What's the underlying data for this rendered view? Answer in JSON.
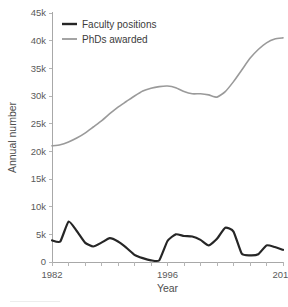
{
  "chart_data": {
    "type": "line",
    "title": "",
    "subtitle": "",
    "xlabel": "Year",
    "ylabel": "Annual number",
    "xlim": [
      1982,
      2010
    ],
    "ylim": [
      0,
      45000
    ],
    "grid": false,
    "legend_position": "top-left",
    "y_ticks": [
      0,
      5000,
      10000,
      15000,
      20000,
      25000,
      30000,
      35000,
      40000,
      45000
    ],
    "y_tick_labels": [
      "0",
      "5k",
      "10k",
      "15k",
      "20k",
      "25k",
      "30k",
      "35k",
      "40k",
      "45k"
    ],
    "x_ticks": [
      1982,
      1984,
      1986,
      1988,
      1990,
      1992,
      1994,
      1996,
      1998,
      2000,
      2002,
      2004,
      2006,
      2008,
      2010
    ],
    "x_tick_labels": [
      "1982",
      "",
      "",
      "",
      "",
      "",
      "",
      "1996",
      "",
      "",
      "",
      "",
      "",
      "",
      "2010"
    ],
    "x_labeled_ticks": [
      {
        "value": 1982,
        "label": "1982"
      },
      {
        "value": 1996,
        "label": "1996"
      },
      {
        "value": 2010,
        "label": "2010"
      }
    ],
    "x": [
      1982,
      1983,
      1984,
      1985,
      1986,
      1987,
      1988,
      1989,
      1990,
      1991,
      1992,
      1993,
      1994,
      1995,
      1996,
      1997,
      1998,
      1999,
      2000,
      2001,
      2002,
      2003,
      2004,
      2005,
      2006,
      2007,
      2008,
      2009,
      2010
    ],
    "series": [
      {
        "name": "Faculty positions",
        "color": "#262626",
        "linewidth": 2.2,
        "values": [
          3900,
          3700,
          7300,
          5600,
          3500,
          2800,
          3500,
          4300,
          3700,
          2600,
          1300,
          700,
          300,
          300,
          3800,
          5000,
          4700,
          4600,
          4000,
          3000,
          4200,
          6200,
          5500,
          1500,
          1200,
          1400,
          3000,
          2700,
          2200
        ]
      },
      {
        "name": "PhDs awarded",
        "color": "#9a9a9a",
        "linewidth": 1.6,
        "values": [
          21000,
          21200,
          21700,
          22400,
          23300,
          24400,
          25500,
          26800,
          28000,
          29000,
          30000,
          30900,
          31400,
          31700,
          31800,
          31500,
          30800,
          30400,
          30400,
          30200,
          29800,
          30800,
          32600,
          34700,
          36800,
          38400,
          39600,
          40300,
          40500
        ]
      }
    ],
    "legend": [
      {
        "label": "Faculty positions",
        "color": "#262626",
        "linewidth": 2.4
      },
      {
        "label": "PhDs awarded",
        "color": "#9a9a9a",
        "linewidth": 1.8
      }
    ]
  }
}
